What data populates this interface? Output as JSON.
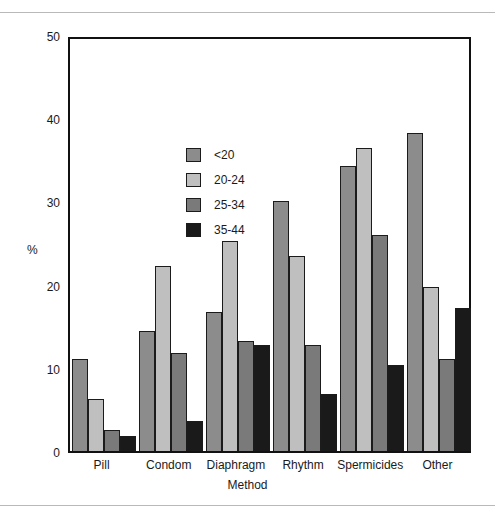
{
  "chart_data": {
    "type": "bar",
    "title": "",
    "xlabel": "Method",
    "ylabel": "%",
    "ylim": [
      0,
      50
    ],
    "yticks": [
      0,
      10,
      20,
      30,
      40,
      50
    ],
    "grid": false,
    "legend_position": "upper-left-inside",
    "categories": [
      "Pill",
      "Condom",
      "Diaphragm",
      "Rhythm",
      "Spermicides",
      "Other"
    ],
    "series": [
      {
        "name": "<20",
        "color": "#8c8c8c",
        "values": [
          11.0,
          14.4,
          16.7,
          30.0,
          34.2,
          38.2
        ]
      },
      {
        "name": "20-24",
        "color": "#bfbfbf",
        "values": [
          6.3,
          22.2,
          25.2,
          23.4,
          36.4,
          19.7
        ]
      },
      {
        "name": "25-34",
        "color": "#7a7a7a",
        "values": [
          2.5,
          11.8,
          13.2,
          12.8,
          26.0,
          11.1
        ]
      },
      {
        "name": "35-44",
        "color": "#1a1a1a",
        "values": [
          1.8,
          3.6,
          12.8,
          6.9,
          10.3,
          17.2
        ]
      }
    ]
  },
  "legend": {
    "items": [
      {
        "label": "<20"
      },
      {
        "label": "20-24"
      },
      {
        "label": "25-34"
      },
      {
        "label": "35-44"
      }
    ]
  },
  "axes": {
    "y_title": "%",
    "x_title": "Method",
    "y_tick_labels": [
      "50",
      "40",
      "30",
      "20",
      "10",
      "0"
    ],
    "x_tick_labels": [
      "Pill",
      "Condom",
      "Diaphragm",
      "Rhythm",
      "Spermicides",
      "Other"
    ]
  }
}
